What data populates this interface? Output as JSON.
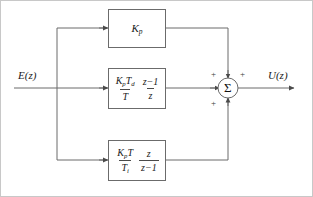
{
  "diagram": {
    "input_label": "E(z)",
    "output_label": "U(z)",
    "summing_junction": {
      "symbol": "Σ",
      "signs": [
        "+",
        "+",
        "+"
      ]
    },
    "blocks": [
      {
        "id": "proportional",
        "name": "proportional-gain-block",
        "expression": "K_p",
        "terms": [
          {
            "type": "plain",
            "text": "K",
            "sub": "p"
          }
        ]
      },
      {
        "id": "derivative",
        "name": "derivative-block",
        "expression": "(K_p T_d / T)((z-1)/z)",
        "terms": [
          {
            "type": "fraction",
            "numerator": "K_pT_d",
            "denominator": "T"
          },
          {
            "type": "fraction",
            "numerator": "z−1",
            "denominator": "z"
          }
        ]
      },
      {
        "id": "integral",
        "name": "integral-block",
        "expression": "(K_p T / T_i)(z/(z-1))",
        "terms": [
          {
            "type": "fraction",
            "numerator": "K_pT",
            "denominator": "T_i"
          },
          {
            "type": "fraction",
            "numerator": "z",
            "denominator": "z−1"
          }
        ]
      }
    ],
    "colors": {
      "line": "#6b6b6b",
      "box_border": "#6b6b6b",
      "text": "#1a1a1a",
      "background": "#ffffff",
      "frame": "#b9b9b9"
    }
  }
}
